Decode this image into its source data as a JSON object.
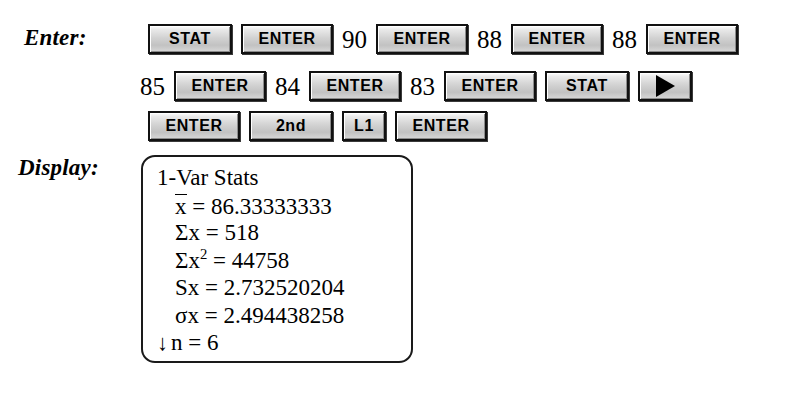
{
  "labels": {
    "enter": "Enter:",
    "display": "Display:"
  },
  "keypad": {
    "rows": [
      {
        "items": [
          {
            "kind": "key",
            "label": "STAT",
            "style": "k-stat",
            "name": "key-stat"
          },
          {
            "kind": "key",
            "label": "ENTER",
            "style": "k-enter",
            "name": "key-enter"
          },
          {
            "kind": "num",
            "label": "90",
            "name": "typed-value-90"
          },
          {
            "kind": "key",
            "label": "ENTER",
            "style": "k-enter",
            "name": "key-enter"
          },
          {
            "kind": "num",
            "label": "88",
            "name": "typed-value-88"
          },
          {
            "kind": "key",
            "label": "ENTER",
            "style": "k-enter",
            "name": "key-enter"
          },
          {
            "kind": "num",
            "label": "88",
            "name": "typed-value-88"
          },
          {
            "kind": "key",
            "label": "ENTER",
            "style": "k-enter",
            "name": "key-enter"
          }
        ]
      },
      {
        "items": [
          {
            "kind": "num",
            "label": "85",
            "name": "typed-value-85"
          },
          {
            "kind": "key",
            "label": "ENTER",
            "style": "k-enter",
            "name": "key-enter"
          },
          {
            "kind": "num",
            "label": "84",
            "name": "typed-value-84"
          },
          {
            "kind": "key",
            "label": "ENTER",
            "style": "k-enter",
            "name": "key-enter"
          },
          {
            "kind": "num",
            "label": "83",
            "name": "typed-value-83"
          },
          {
            "kind": "key",
            "label": "ENTER",
            "style": "k-enter",
            "name": "key-enter"
          },
          {
            "kind": "key",
            "label": "STAT",
            "style": "k-stat",
            "name": "key-stat"
          },
          {
            "kind": "arrow",
            "label": "",
            "style": "k-arrow",
            "name": "key-right-arrow"
          }
        ]
      },
      {
        "items": [
          {
            "kind": "key",
            "label": "ENTER",
            "style": "k-enter",
            "name": "key-enter"
          },
          {
            "kind": "key",
            "label": "2nd",
            "style": "k-2nd",
            "name": "key-2nd"
          },
          {
            "kind": "key",
            "label": "L1",
            "style": "k-l1",
            "name": "key-l1"
          },
          {
            "kind": "key",
            "label": "ENTER",
            "style": "k-enter",
            "name": "key-enter"
          }
        ]
      }
    ]
  },
  "display": {
    "title": "1-Var Stats",
    "lines": [
      {
        "name": "display-line-title",
        "indent": false,
        "prefix": "",
        "var": "1-Var Stats",
        "overbar": false,
        "sup": "",
        "eq": "",
        "value": ""
      },
      {
        "name": "display-line-xbar",
        "indent": true,
        "prefix": "",
        "var": "x",
        "overbar": true,
        "sup": "",
        "eq": "=",
        "value": "86.33333333"
      },
      {
        "name": "display-line-sumx",
        "indent": true,
        "prefix": "",
        "var": "Σx",
        "overbar": false,
        "sup": "",
        "eq": "=",
        "value": "518"
      },
      {
        "name": "display-line-sumx2",
        "indent": true,
        "prefix": "",
        "var": "Σx",
        "overbar": false,
        "sup": "2",
        "eq": "=",
        "value": "44758"
      },
      {
        "name": "display-line-sx",
        "indent": true,
        "prefix": "",
        "var": "Sx",
        "overbar": false,
        "sup": "",
        "eq": "=",
        "value": "2.732520204"
      },
      {
        "name": "display-line-sigmax",
        "indent": true,
        "prefix": "",
        "var": "σx",
        "overbar": false,
        "sup": "",
        "eq": "=",
        "value": "2.494438258"
      },
      {
        "name": "display-line-n",
        "indent": false,
        "prefix": "↓",
        "var": "n",
        "overbar": false,
        "sup": "",
        "eq": "=",
        "value": "6"
      }
    ]
  },
  "colors": {
    "background": "#ffffff",
    "text": "#000000",
    "key_face": "#d2d2d2",
    "key_border": "#111111"
  }
}
